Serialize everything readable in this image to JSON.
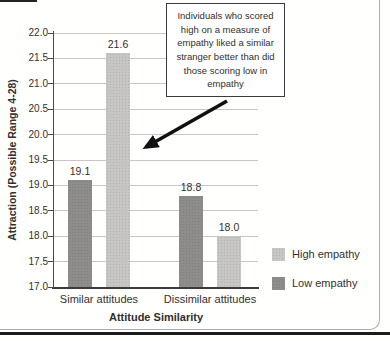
{
  "chart_data": {
    "type": "bar",
    "title": "",
    "categories": [
      "Similar attitudes",
      "Dissimilar attitudes"
    ],
    "series": [
      {
        "name": "Low empathy",
        "values": [
          19.1,
          18.8
        ],
        "labels": [
          "19.1",
          "18.8"
        ],
        "color": "#8f8d8b"
      },
      {
        "name": "High empathy",
        "values": [
          21.6,
          18.0
        ],
        "labels": [
          "21.6",
          "18.0"
        ],
        "color": "#c8c6c4"
      }
    ],
    "xlabel": "Attitude Similarity",
    "ylabel": "Attraction (Possible Range 4-28)",
    "ylim": [
      17.0,
      22.0
    ],
    "yticks": [
      "22.0",
      "21.5",
      "21.0",
      "20.5",
      "20.0",
      "19.5",
      "19.0",
      "18.5",
      "18.0",
      "17.5",
      "17.0"
    ],
    "grid": true,
    "legend_position": "right"
  },
  "annotation": {
    "text": "Individuals who scored high on a measure of empathy liked a similar stranger better than did those scoring low in empathy",
    "lines": [
      "Individuals who scored",
      "high on a measure of",
      "empathy liked a similar",
      "stranger better than did",
      "those scoring low in",
      "empathy"
    ]
  },
  "legend": {
    "items": [
      {
        "label": "High empathy",
        "color": "#c8c6c4"
      },
      {
        "label": "Low empathy",
        "color": "#8f8d8b"
      }
    ]
  },
  "colors": {
    "grid": "#c9c7c5",
    "axis": "#4c4a48",
    "text": "#33302d",
    "frame": "#adadad",
    "rule": "#1c1c1c",
    "arrow": "#111111"
  }
}
